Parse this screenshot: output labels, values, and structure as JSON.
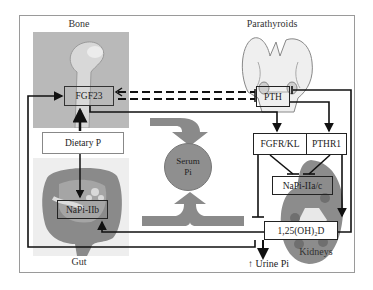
{
  "organs": {
    "bone": "Bone",
    "parathyroids": "Parathyroids",
    "gut": "Gut",
    "kidneys": "Kidneys"
  },
  "nodes": {
    "fgf23": "FGF23",
    "pth": "PTH",
    "dietary_p": "Dietary P",
    "napi_iib": "NaPi-IIb",
    "fgfr_kl": "FGFR/KL",
    "pthr1": "PTHR1",
    "napi_iiac": "NaPi-IIa/c",
    "calcitriol": "1,25(OH)₂D"
  },
  "center": {
    "line1": "Serum",
    "line2": "Pi"
  },
  "output": {
    "arrow": "↑",
    "label": "Urine Pi"
  },
  "colors": {
    "circle": "#8f8f8f",
    "big_arrows": "#8a8a8a",
    "lines": "#111111",
    "frame": "#9a9a9a"
  }
}
